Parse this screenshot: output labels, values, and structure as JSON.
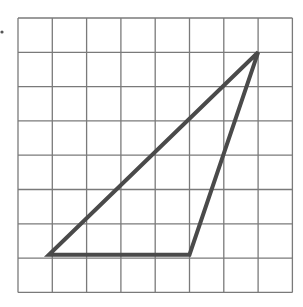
{
  "figure": {
    "type": "grid-triangle",
    "grid": {
      "columns": 8,
      "rows": 8,
      "origin_px": [
        18,
        18
      ],
      "cell_px": 34.3,
      "line_color": "#7a7a7a",
      "line_width": 1.3
    },
    "bullet_marker": {
      "x": 2,
      "y": 32,
      "r": 1.6,
      "color": "#555555"
    },
    "triangle": {
      "vertices_grid": [
        {
          "col": 0.9,
          "row": 6.9,
          "label": "bottom-left"
        },
        {
          "col": 5.0,
          "row": 6.9,
          "label": "bottom-right"
        },
        {
          "col": 7.0,
          "row": 1.0,
          "label": "top-right"
        }
      ],
      "stroke_color": "#4a4a4a",
      "stroke_width": 4
    }
  }
}
